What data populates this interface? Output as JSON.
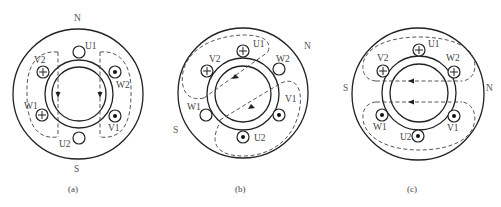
{
  "figure": {
    "panels": [
      {
        "id": "a",
        "caption": "(a)",
        "poles": {
          "N": "N",
          "S": "S"
        },
        "slots": {
          "U1": {
            "label": "U1",
            "current": "none"
          },
          "U2": {
            "label": "U2",
            "current": "none"
          },
          "V1": {
            "label": "V1",
            "current": "out"
          },
          "V2": {
            "label": "V2",
            "current": "in"
          },
          "W1": {
            "label": "W1",
            "current": "in"
          },
          "W2": {
            "label": "W2",
            "current": "out"
          }
        },
        "field_direction": "top-to-bottom"
      },
      {
        "id": "b",
        "caption": "(b)",
        "poles": {
          "N": "N",
          "S": "S"
        },
        "slots": {
          "U1": {
            "label": "U1",
            "current": "in"
          },
          "U2": {
            "label": "U2",
            "current": "out"
          },
          "V1": {
            "label": "V1",
            "current": "out"
          },
          "V2": {
            "label": "V2",
            "current": "in"
          },
          "W1": {
            "label": "W1",
            "current": "none"
          },
          "W2": {
            "label": "W2",
            "current": "none"
          }
        },
        "field_direction": "upper-right-to-lower-left"
      },
      {
        "id": "c",
        "caption": "(c)",
        "poles": {
          "N": "N",
          "S": "S"
        },
        "slots": {
          "U1": {
            "label": "U1",
            "current": "in"
          },
          "U2": {
            "label": "U2",
            "current": "out"
          },
          "V1": {
            "label": "V1",
            "current": "out"
          },
          "V2": {
            "label": "V2",
            "current": "in"
          },
          "W1": {
            "label": "W1",
            "current": "out"
          },
          "W2": {
            "label": "W2",
            "current": "in"
          }
        },
        "field_direction": "right-to-left"
      }
    ],
    "legend": {
      "in_symbol": "⊕",
      "out_symbol": "⊙"
    }
  }
}
